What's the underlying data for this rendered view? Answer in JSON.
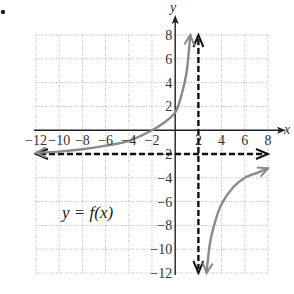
{
  "chart_data": {
    "type": "line",
    "title": "",
    "xlabel": "x",
    "ylabel": "y",
    "xlim": [
      -12,
      8
    ],
    "ylim": [
      -12,
      8
    ],
    "grid": true,
    "grid_step": 2,
    "x_ticks": [
      -12,
      -10,
      -8,
      -6,
      -4,
      -2,
      2,
      4,
      6,
      8
    ],
    "y_ticks": [
      8,
      6,
      4,
      2,
      -2,
      -4,
      -6,
      -8,
      -10,
      -12
    ],
    "x_tick_labels": [
      "−12",
      "−10",
      "−8",
      "−6",
      "−4",
      "−2",
      "2",
      "4",
      "6",
      "8"
    ],
    "y_tick_labels": [
      "8",
      "6",
      "4",
      "2",
      "−2",
      "−4",
      "−6",
      "−8",
      "−10",
      "−12"
    ],
    "annotation": "y = f(x)",
    "asymptotes": [
      {
        "type": "vertical",
        "x": 2,
        "style": "dashed"
      },
      {
        "type": "horizontal",
        "y": -2,
        "style": "dashed"
      }
    ],
    "series": [
      {
        "name": "f(x) left branch",
        "x": [
          -12,
          -10,
          -8,
          -6,
          -4,
          -2,
          -1,
          0,
          0.5,
          1,
          1.3
        ],
        "y": [
          -1.9,
          -1.8,
          -1.6,
          -1.3,
          -0.9,
          0,
          0.6,
          1.5,
          2.8,
          5,
          8
        ]
      },
      {
        "name": "f(x) right branch",
        "x": [
          2.7,
          3,
          3.5,
          4,
          5,
          6,
          7,
          8
        ],
        "y": [
          -12,
          -9.5,
          -7.5,
          -6.2,
          -4.8,
          -4,
          -3.6,
          -3.2
        ]
      }
    ]
  },
  "labels": {
    "x_axis": "x",
    "y_axis": "y",
    "equation": "y = f(x)"
  }
}
